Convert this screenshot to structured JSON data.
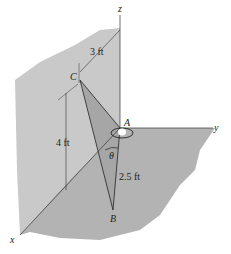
{
  "diagram": {
    "axes": {
      "x": "x",
      "y": "y",
      "z": "z"
    },
    "points": {
      "A": "A",
      "B": "B",
      "C": "C"
    },
    "dimensions": {
      "horizontal": "3 ft",
      "vertical": "4 ft",
      "ab": "2.5 ft"
    },
    "angle": "θ",
    "colors": {
      "wall": "#c9c9c9",
      "floor": "#b3b3b3",
      "triangle": "#a6a6a6",
      "line": "#222222"
    }
  }
}
